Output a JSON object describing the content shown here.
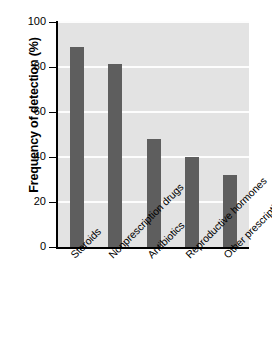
{
  "chart_data": {
    "type": "bar",
    "title": "",
    "xlabel": "",
    "ylabel": "Frequency of detection (%)",
    "categories": [
      "Steroids",
      "Nonprescription drugs",
      "Antibiotics",
      "Reproductive hormones",
      "Other prescription drugs"
    ],
    "values": [
      89,
      81.5,
      48,
      40,
      32
    ],
    "ylim": [
      0,
      100
    ],
    "yticks": [
      0,
      20,
      40,
      60,
      80,
      100
    ],
    "ytick_labels": [
      "0",
      "20",
      "40",
      "60",
      "80",
      "100"
    ],
    "grid": "horizontal",
    "legend": "none",
    "bar_color": "#5e5e5e",
    "plot_background": "#e3e3e3",
    "gridline_color": "#fdfdfd",
    "axis_color": "#000000",
    "page_background": "#ffffff"
  }
}
